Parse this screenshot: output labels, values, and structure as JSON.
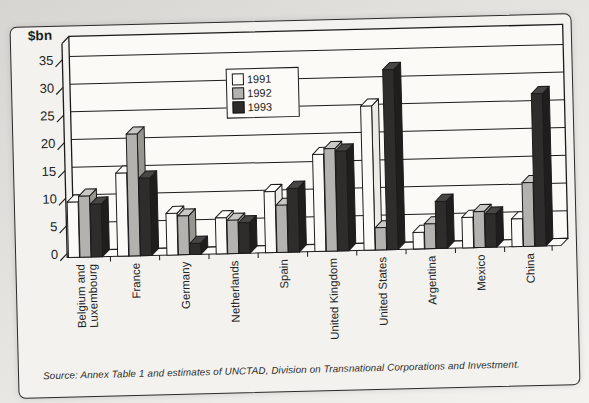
{
  "figure": {
    "source": "Source: Annex Table 1 and estimates of UNCTAD, Division on Transnational Corporations and Investment."
  },
  "palette": {
    "outline": "#1b1b1b",
    "wall_fill": "#fbfaf6",
    "paper": "#f3f2ee"
  },
  "chart_data": {
    "type": "bar",
    "title": "",
    "xlabel": "",
    "ylabel": "$bn",
    "ylim": [
      0,
      35
    ],
    "yticks": [
      0,
      5,
      10,
      15,
      20,
      25,
      30,
      35
    ],
    "grid": true,
    "style": "3d-column",
    "legend_position": "upper-left-inside-plot",
    "categories": [
      "Belgium and Luxembourg",
      "France",
      "Germany",
      "Netherlands",
      "Spain",
      "United Kingdom",
      "United States",
      "Argentina",
      "Mexico",
      "China"
    ],
    "series": [
      {
        "name": "1991",
        "values": [
          10,
          15,
          7.5,
          6.5,
          11,
          17.5,
          26,
          3,
          5.5,
          5
        ],
        "colors": {
          "front": "#fbfaf6",
          "top": "#fefdfa",
          "side": "#eceae4"
        }
      },
      {
        "name": "1992",
        "values": [
          11,
          22,
          7,
          6,
          8.5,
          18.5,
          4,
          4.5,
          6.5,
          11.5
        ],
        "colors": {
          "front": "#b3b2af",
          "top": "#c9c8c4",
          "side": "#96958f"
        }
      },
      {
        "name": "1993",
        "values": [
          9.5,
          14,
          2,
          5.5,
          11.5,
          18,
          32.5,
          8.5,
          6,
          27.5
        ],
        "colors": {
          "front": "#2e2d2c",
          "top": "#474644",
          "side": "#1f1e1d"
        }
      }
    ]
  }
}
